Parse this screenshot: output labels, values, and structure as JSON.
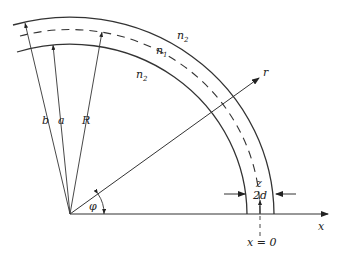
{
  "diagram": {
    "labels": {
      "outer_cladding_top": {
        "base": "n",
        "sub": "2"
      },
      "core": {
        "base": "n",
        "sub": "1"
      },
      "inner_cladding": {
        "base": "n",
        "sub": "2"
      },
      "radius_b": "b",
      "radius_a": "a",
      "radius_R": "R",
      "radial_axis": "r",
      "angle": "φ",
      "z_axis": "z",
      "thickness": "2d",
      "x_axis": "x",
      "x_origin": "x = 0"
    },
    "colors": {
      "line": "#333333",
      "background": "#ffffff"
    }
  }
}
